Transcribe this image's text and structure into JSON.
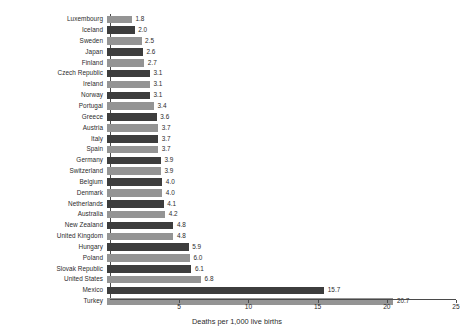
{
  "chart_data": {
    "type": "bar",
    "orientation": "horizontal",
    "title": "",
    "xlabel": "Deaths per 1,000 live births",
    "ylabel": "",
    "xlim": [
      0,
      25
    ],
    "xticks": [
      5,
      10,
      15,
      20,
      25
    ],
    "xtick_labels": [
      "5",
      "10",
      "15",
      "20",
      "25"
    ],
    "grid": false,
    "legend": "none",
    "bar_colors": {
      "light": "#949494",
      "dark": "#3d3d3d"
    },
    "categories": [
      "Luxembourg",
      "Iceland",
      "Sweden",
      "Japan",
      "Finland",
      "Czech Republic",
      "Ireland",
      "Norway",
      "Portugal",
      "Greece",
      "Austria",
      "Italy",
      "Spain",
      "Germany",
      "Switzerland",
      "Belgium",
      "Denmark",
      "Netherlands",
      "Australia",
      "New Zealand",
      "United Kingdom",
      "Hungary",
      "Poland",
      "Slovak Republic",
      "United States",
      "Mexico",
      "Turkey"
    ],
    "values": [
      1.8,
      2.0,
      2.5,
      2.6,
      2.7,
      3.1,
      3.1,
      3.1,
      3.4,
      3.6,
      3.7,
      3.7,
      3.7,
      3.9,
      3.9,
      4.0,
      4.0,
      4.1,
      4.2,
      4.8,
      4.8,
      5.9,
      6.0,
      6.1,
      6.8,
      15.7,
      20.7
    ],
    "value_labels": [
      "1.8",
      "2.0",
      "2.5",
      "2.6",
      "2.7",
      "3.1",
      "3.1",
      "3.1",
      "3.4",
      "3.6",
      "3.7",
      "3.7",
      "3.7",
      "3.9",
      "3.9",
      "4.0",
      "4.0",
      "4.1",
      "4.2",
      "4.8",
      "4.8",
      "5.9",
      "6.0",
      "6.1",
      "6.8",
      "15.7",
      "20.7"
    ]
  }
}
